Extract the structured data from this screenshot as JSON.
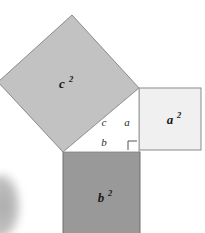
{
  "figure": {
    "background_color": "#ffffff",
    "width": 205,
    "height": 233
  },
  "squares": {
    "hypotenuse": {
      "label_base": "c",
      "label_exponent": "2",
      "fill_color": "#c2c2c2",
      "stroke_color": "#8a8a8a",
      "points": "-2,82 72,15 139,88 63,152",
      "label_x": 62,
      "label_y": 88
    },
    "leg_a": {
      "label_base": "a",
      "label_exponent": "2",
      "fill_color": "#f0f0f0",
      "stroke_color": "#8a8a8a",
      "x": 139,
      "y": 88,
      "width": 62,
      "height": 62,
      "label_x": 170,
      "label_y": 124
    },
    "leg_b": {
      "label_base": "b",
      "label_exponent": "2",
      "fill_color": "#999999",
      "stroke_color": "#6f6f6f",
      "x": 63,
      "y": 152,
      "width": 77,
      "height": 82,
      "label_x": 101,
      "label_y": 202
    }
  },
  "triangle": {
    "fill_color": "#ffffff",
    "stroke_color": "#9a9a9a",
    "points": "63,152 139,88 139,152",
    "side_labels": [
      {
        "name": "hypotenuse",
        "text": "c",
        "x": 104,
        "y": 126
      },
      {
        "name": "leg-a",
        "text": "a",
        "x": 127,
        "y": 126
      },
      {
        "name": "leg-b",
        "text": "b",
        "x": 104,
        "y": 146
      }
    ],
    "right_angle_mark": {
      "points": "128,150 128,141 137,141",
      "stroke_color": "#555555"
    }
  },
  "artifact": {
    "name": "scan-edge-smudge",
    "color_outer": "#d8d8d8",
    "color_inner": "#a8a8a8",
    "x": -16,
    "y": 172,
    "width": 38,
    "height": 68
  }
}
